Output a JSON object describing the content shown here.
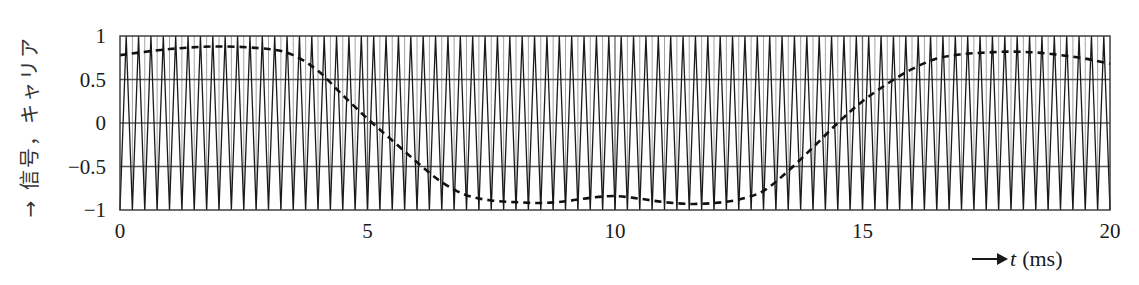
{
  "chart_data": {
    "type": "line",
    "title": "",
    "xlabel": "t (ms)",
    "ylabel": "信号，キャリア",
    "xlim": [
      0,
      20
    ],
    "ylim": [
      -1,
      1
    ],
    "x_ticks": [
      "0",
      "5",
      "10",
      "15",
      "20"
    ],
    "y_ticks": [
      "1",
      "0.5",
      "0",
      "−0.5",
      "−1"
    ],
    "grid": true,
    "series": [
      {
        "name": "carrier (triangle wave)",
        "style": "solid",
        "periods": 80,
        "amplitude": 1,
        "start_value": -1
      },
      {
        "name": "signal",
        "style": "dashed",
        "x": [
          0,
          1,
          2,
          3,
          3.5,
          4,
          4.5,
          5,
          5.5,
          6,
          6.5,
          7,
          7.5,
          8,
          8.5,
          9,
          9.5,
          10,
          10.5,
          11,
          11.5,
          12,
          12.5,
          13,
          13.5,
          14,
          14.5,
          15,
          15.5,
          16,
          16.5,
          17,
          17.5,
          18,
          18.5,
          19,
          19.5,
          20
        ],
        "values": [
          0.78,
          0.85,
          0.88,
          0.85,
          0.78,
          0.6,
          0.32,
          0.05,
          -0.2,
          -0.45,
          -0.68,
          -0.83,
          -0.89,
          -0.91,
          -0.92,
          -0.9,
          -0.86,
          -0.84,
          -0.87,
          -0.91,
          -0.93,
          -0.92,
          -0.88,
          -0.78,
          -0.55,
          -0.28,
          0.0,
          0.25,
          0.45,
          0.62,
          0.74,
          0.79,
          0.81,
          0.82,
          0.81,
          0.78,
          0.74,
          0.68
        ]
      }
    ]
  },
  "labels": {
    "ylabel": "→ 信号，キャリア",
    "xlabel_var": "t",
    "xlabel_unit": "(ms)"
  }
}
